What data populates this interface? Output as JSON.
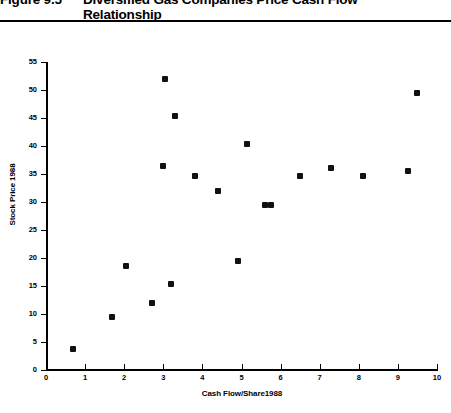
{
  "figure": {
    "number": "Figure 9.5",
    "title": "Diversified Gas Companies Price\nCash Flow Relationship"
  },
  "chart_data": {
    "type": "scatter",
    "title": "Diversified Gas Companies Price Cash Flow Relationship",
    "xlabel": "Cash Flow/Share1988",
    "ylabel": "Stock Price 1988",
    "xlim": [
      0,
      10
    ],
    "ylim": [
      0,
      55
    ],
    "xticks": [
      0,
      1,
      2,
      3,
      4,
      5,
      6,
      7,
      8,
      9,
      10
    ],
    "yticks": [
      0,
      5,
      10,
      15,
      20,
      25,
      30,
      35,
      40,
      45,
      50,
      55
    ],
    "grid": false,
    "legend": null,
    "marker": "filled-square",
    "marker_color": "#111111",
    "points": [
      {
        "x": 0.7,
        "y": 3.8
      },
      {
        "x": 1.7,
        "y": 9.4
      },
      {
        "x": 2.05,
        "y": 18.6
      },
      {
        "x": 2.7,
        "y": 12.0
      },
      {
        "x": 3.0,
        "y": 36.5
      },
      {
        "x": 3.05,
        "y": 52.0
      },
      {
        "x": 3.2,
        "y": 15.3
      },
      {
        "x": 3.3,
        "y": 45.3
      },
      {
        "x": 3.8,
        "y": 34.6
      },
      {
        "x": 4.4,
        "y": 32.0
      },
      {
        "x": 4.9,
        "y": 19.4
      },
      {
        "x": 5.15,
        "y": 40.3
      },
      {
        "x": 5.6,
        "y": 29.4
      },
      {
        "x": 5.75,
        "y": 29.4
      },
      {
        "x": 6.5,
        "y": 34.7
      },
      {
        "x": 7.3,
        "y": 36.0
      },
      {
        "x": 8.1,
        "y": 34.7
      },
      {
        "x": 9.25,
        "y": 35.6
      },
      {
        "x": 9.5,
        "y": 49.5
      }
    ]
  }
}
